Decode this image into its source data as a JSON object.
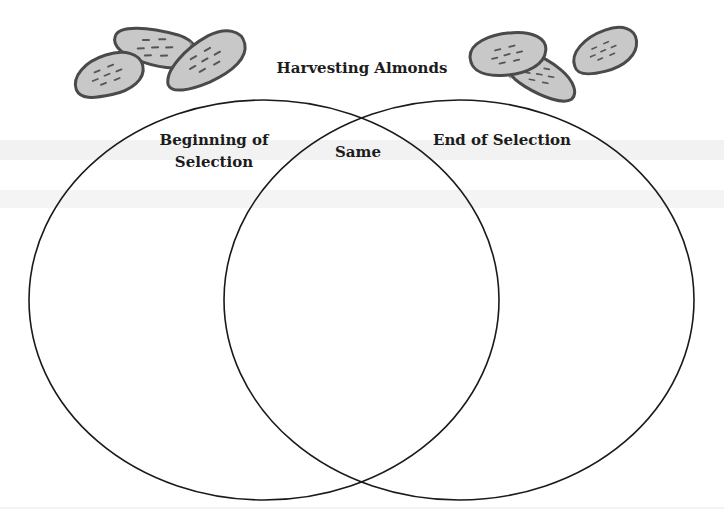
{
  "diagram": {
    "type": "venn",
    "title": "Harvesting Almonds",
    "sets": [
      {
        "id": "left",
        "label": "Beginning of Selection",
        "label_lines": [
          "Beginning of",
          "Selection"
        ]
      },
      {
        "id": "overlap",
        "label": "Same"
      },
      {
        "id": "right",
        "label": "End of Selection"
      }
    ],
    "decorations": {
      "left_cluster": "almond-icons (3 almonds)",
      "right_cluster": "almond-icons (3 almonds)"
    },
    "colors": {
      "almond_fill": "#c8c8c8",
      "almond_outline": "#4a4a4a",
      "almond_dash": "#555555",
      "circle_stroke": "#1a1a1a",
      "background": "#ffffff"
    }
  }
}
